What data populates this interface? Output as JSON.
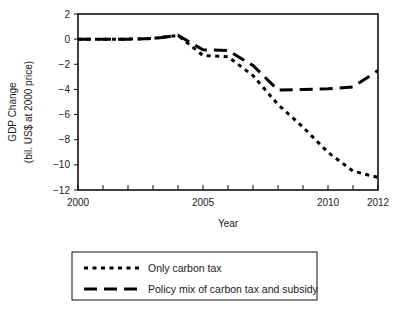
{
  "chart_data": {
    "type": "line",
    "title": "",
    "xlabel": "Year",
    "ylabel": "GDP Change\n(bil. US$ at 2000 price)",
    "ylabel_line1": "GDP Change",
    "ylabel_line2": "(bil. US$ at 2000 price)",
    "x": [
      2000,
      2001,
      2002,
      2003,
      2004,
      2005,
      2006,
      2007,
      2008,
      2009,
      2010,
      2011,
      2012
    ],
    "xlim": [
      2000,
      2012
    ],
    "ylim": [
      -12,
      2
    ],
    "xticks": [
      2000,
      2001,
      2002,
      2003,
      2004,
      2005,
      2006,
      2007,
      2008,
      2009,
      2010,
      2011,
      2012
    ],
    "xtick_labels_shown": [
      "2000",
      "2005",
      "2010",
      "2012"
    ],
    "xtick_labels_shown_values": [
      2000,
      2005,
      2010,
      2012
    ],
    "yticks": [
      2,
      0,
      -2,
      -4,
      -6,
      -8,
      -10,
      -12
    ],
    "ytick_labels": [
      "2",
      "0",
      "−2",
      "−4",
      "−6",
      "−8",
      "−10",
      "−12"
    ],
    "grid": false,
    "legend_position": "below",
    "series": [
      {
        "name": "Only carbon tax",
        "style": "dotted",
        "color": "#000000",
        "values": [
          0.0,
          0.0,
          0.0,
          0.05,
          0.3,
          -1.3,
          -1.4,
          -2.9,
          -5.2,
          -7.0,
          -9.0,
          -10.5,
          -11.0
        ]
      },
      {
        "name": "Policy mix of carbon tax and subsidy",
        "style": "dashed",
        "color": "#000000",
        "values": [
          0.0,
          0.0,
          0.0,
          0.05,
          0.3,
          -0.85,
          -0.9,
          -2.1,
          -4.05,
          -4.0,
          -3.95,
          -3.8,
          -2.5
        ]
      }
    ]
  },
  "legend": {
    "items": [
      {
        "label": "Only carbon tax",
        "style": "dotted"
      },
      {
        "label": "Policy mix of carbon tax and subsidy",
        "style": "dashed"
      }
    ]
  },
  "axes": {
    "x_title": "Year",
    "y_title_line1": "GDP Change",
    "y_title_line2": "(bil. US$ at 2000 price)"
  }
}
